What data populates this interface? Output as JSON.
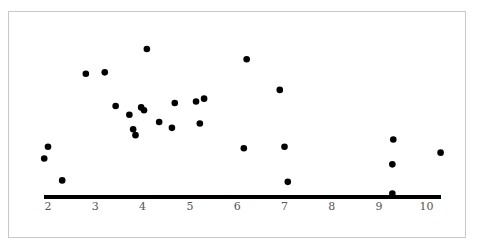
{
  "chart_data": {
    "type": "scatter",
    "title": "",
    "xlabel": "",
    "ylabel": "",
    "xlim": [
      1.9,
      10.3
    ],
    "ylim": [
      0,
      100
    ],
    "grid": false,
    "legend": null,
    "x_ticks": [
      "2",
      "3",
      "4",
      "5",
      "6",
      "7",
      "8",
      "9",
      "10"
    ],
    "points": [
      {
        "x": 1.92,
        "y": 25
      },
      {
        "x": 2.0,
        "y": 33
      },
      {
        "x": 2.3,
        "y": 10
      },
      {
        "x": 2.8,
        "y": 83
      },
      {
        "x": 3.2,
        "y": 84
      },
      {
        "x": 3.43,
        "y": 61
      },
      {
        "x": 3.72,
        "y": 55
      },
      {
        "x": 3.8,
        "y": 45
      },
      {
        "x": 3.85,
        "y": 41
      },
      {
        "x": 3.97,
        "y": 60
      },
      {
        "x": 4.03,
        "y": 58
      },
      {
        "x": 4.09,
        "y": 100
      },
      {
        "x": 4.35,
        "y": 50
      },
      {
        "x": 4.62,
        "y": 46
      },
      {
        "x": 4.68,
        "y": 63
      },
      {
        "x": 5.13,
        "y": 64
      },
      {
        "x": 5.21,
        "y": 49
      },
      {
        "x": 5.3,
        "y": 66
      },
      {
        "x": 6.14,
        "y": 32
      },
      {
        "x": 6.2,
        "y": 93
      },
      {
        "x": 6.9,
        "y": 72
      },
      {
        "x": 7.0,
        "y": 33
      },
      {
        "x": 7.07,
        "y": 9
      },
      {
        "x": 9.3,
        "y": 38
      },
      {
        "x": 9.28,
        "y": 21
      },
      {
        "x": 9.28,
        "y": 1
      },
      {
        "x": 10.3,
        "y": 29
      }
    ]
  },
  "axis": {
    "x0_px": 48,
    "px_per_unit": 47.3,
    "y_axis_px": 197,
    "y_top_px": 49
  }
}
